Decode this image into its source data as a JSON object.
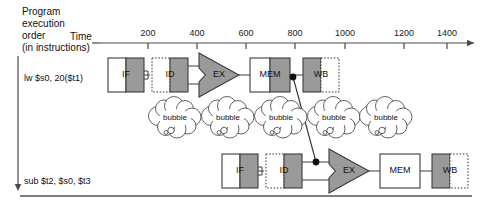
{
  "labels": {
    "program_line1": "Program",
    "program_line2": "execution",
    "program_line3": "order",
    "program_line4": "(in instructions)",
    "time": "Time"
  },
  "axis": {
    "ticks": [
      200,
      400,
      600,
      800,
      1000,
      1200,
      1400
    ],
    "tick_x": [
      148,
      197,
      246,
      295,
      345,
      404,
      447
    ],
    "label_y": 28,
    "line_y": 43,
    "arrow_end_x": 474
  },
  "instructions": [
    {
      "text": "lw $s0, 20($t1)",
      "x": 24,
      "y": 73
    },
    {
      "text": "sub $t2, $s0, $t3",
      "x": 24,
      "y": 176
    }
  ],
  "rows": [
    {
      "name": "lw-row",
      "y": 58,
      "stages": [
        {
          "id": "IF",
          "label": "IF",
          "x": 108,
          "w": 36,
          "style": "solid-half-gray"
        },
        {
          "id": "ID",
          "label": "ID",
          "x": 152,
          "w": 36,
          "style": "dashed-left-gray-right"
        },
        {
          "id": "EX",
          "label": "EX",
          "x": 199,
          "w": 40,
          "style": "alu"
        },
        {
          "id": "MEM",
          "label": "MEM",
          "x": 250,
          "w": 40,
          "style": "solid-half-gray"
        },
        {
          "id": "WB",
          "label": "WB",
          "x": 303,
          "w": 36,
          "style": "gray-left-dashed-right"
        }
      ]
    },
    {
      "name": "sub-row",
      "y": 154,
      "stages": [
        {
          "id": "IF",
          "label": "IF",
          "x": 222,
          "w": 36,
          "style": "solid-half-gray"
        },
        {
          "id": "ID",
          "label": "ID",
          "x": 266,
          "w": 36,
          "style": "dashed-left-gray-right"
        },
        {
          "id": "EX",
          "label": "EX",
          "x": 329,
          "w": 40,
          "style": "alu"
        },
        {
          "id": "MEM",
          "label": "MEM",
          "x": 380,
          "w": 40,
          "style": "solid-plain"
        },
        {
          "id": "WB",
          "label": "WB",
          "x": 432,
          "w": 36,
          "style": "gray-left-dashed-right"
        }
      ]
    }
  ],
  "bubbles": {
    "label": "bubble",
    "count": 5,
    "cx": [
      175,
      228,
      281,
      334,
      386
    ],
    "cy": 118
  },
  "forwarding": {
    "from": {
      "x": 293,
      "y": 77
    },
    "to": {
      "x": 316,
      "y": 162
    },
    "dot_radius": 3.4
  },
  "colors": {
    "stage_gray": "#9a9a9a",
    "stage_white": "#ffffff",
    "alu_gray": "#9a9a9a",
    "stroke": "#3c3c3c",
    "text": "#111111",
    "axis": "#4a4a4a",
    "rule": "#555555"
  },
  "rules": {
    "vertical_arrow": {
      "x": 18,
      "y1": 56,
      "y2": 191
    },
    "bottom_rule_y": 196
  }
}
